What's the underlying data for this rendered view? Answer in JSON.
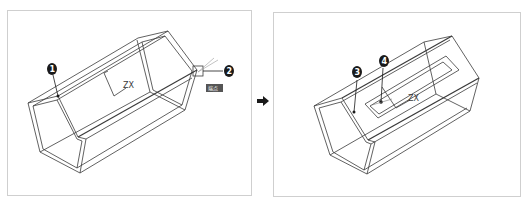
{
  "figure": {
    "type": "CAD wireframe step illustration",
    "colors": {
      "line": "#3a3a3a",
      "callout_fill": "#1a1a1a",
      "panel_border": "#cfcfcf",
      "tag_fill": "#555555"
    }
  },
  "left_panel": {
    "ucs_icon_label": "ZX",
    "callouts": [
      {
        "number": "1"
      },
      {
        "number": "2"
      }
    ],
    "snap_tag": "端点"
  },
  "arrow": {
    "icon": "right-arrow-icon"
  },
  "right_panel": {
    "ucs_icon_label": "ZX",
    "callouts": [
      {
        "number": "3"
      },
      {
        "number": "4"
      }
    ]
  }
}
